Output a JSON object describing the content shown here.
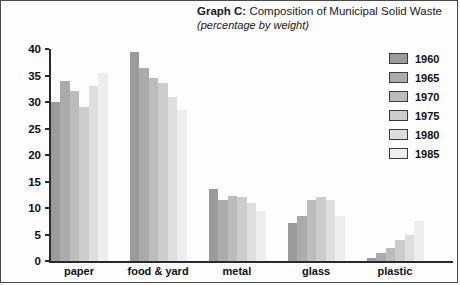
{
  "title": {
    "label": "Graph C:",
    "text": " Composition of Municipal Solid Waste",
    "subtitle": "(percentage by weight)"
  },
  "axis": {
    "ylabel": "Percent",
    "yticks": [
      "40",
      "35",
      "30",
      "25",
      "20",
      "15",
      "10",
      "5",
      "0"
    ]
  },
  "legend": {
    "position": "right",
    "entries": [
      {
        "label": "1960",
        "color": "#9b9b9b"
      },
      {
        "label": "1965",
        "color": "#ababab"
      },
      {
        "label": "1970",
        "color": "#bcbcbc"
      },
      {
        "label": "1975",
        "color": "#cccccc"
      },
      {
        "label": "1980",
        "color": "#dedede"
      },
      {
        "label": "1985",
        "color": "#eeeeee"
      }
    ]
  },
  "chart_data": {
    "type": "bar",
    "title": "Graph C: Composition of Municipal Solid Waste",
    "subtitle": "(percentage by weight)",
    "xlabel": "",
    "ylabel": "Percent",
    "ylim": [
      0,
      40
    ],
    "yticks": [
      0,
      5,
      10,
      15,
      20,
      25,
      30,
      35,
      40
    ],
    "grid": false,
    "legend_position": "right",
    "categories": [
      "paper",
      "food & yard",
      "metal",
      "glass",
      "plastic"
    ],
    "series": [
      {
        "name": "1960",
        "color": "#9b9b9b",
        "values": [
          30.0,
          39.5,
          13.5,
          7.2,
          0.5
        ]
      },
      {
        "name": "1965",
        "color": "#ababab",
        "values": [
          34.0,
          36.5,
          11.5,
          8.5,
          1.5
        ]
      },
      {
        "name": "1970",
        "color": "#bcbcbc",
        "values": [
          32.0,
          34.5,
          12.2,
          11.5,
          2.5
        ]
      },
      {
        "name": "1975",
        "color": "#cccccc",
        "values": [
          29.0,
          33.5,
          12.0,
          12.0,
          4.0
        ]
      },
      {
        "name": "1980",
        "color": "#dedede",
        "values": [
          33.0,
          31.0,
          11.0,
          11.5,
          5.0
        ]
      },
      {
        "name": "1985",
        "color": "#eeeeee",
        "values": [
          35.5,
          28.5,
          9.5,
          8.5,
          7.5
        ]
      }
    ]
  }
}
